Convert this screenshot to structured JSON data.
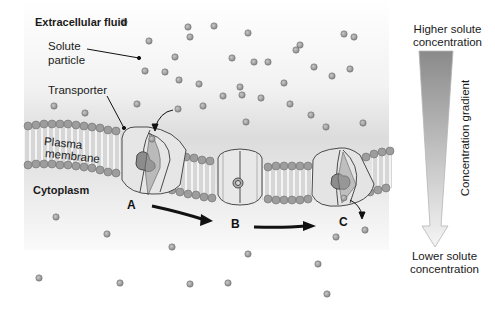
{
  "diagram": {
    "labels": {
      "extracellular": "Extracellular fluid",
      "solute_line1": "Solute",
      "solute_line2": "particle",
      "transporter": "Transporter",
      "membrane_line1": "Plasma",
      "membrane_line2": "membrane",
      "cytoplasm": "Cytoplasm",
      "stage_a": "A",
      "stage_b": "B",
      "stage_c": "C"
    },
    "gradient": {
      "top_line1": "Higher solute",
      "top_line2": "concentration",
      "bottom_line1": "Lower solute",
      "bottom_line2": "concentration",
      "axis_label": "Concentration gradient"
    },
    "colors": {
      "background_top": "#ffffff",
      "background_bottom": "#e6e6e6",
      "particle": "#9a9a9a",
      "transporter": "#e4e4e4",
      "binding_site": "#8c8c8c",
      "lipid_head": "#9d9d9d"
    },
    "particles_outside": [
      [
        124,
        22
      ],
      [
        188,
        27
      ],
      [
        214,
        26
      ],
      [
        248,
        33
      ],
      [
        232,
        58
      ],
      [
        300,
        45
      ],
      [
        296,
        50
      ],
      [
        344,
        34
      ],
      [
        354,
        37
      ],
      [
        254,
        62
      ],
      [
        165,
        72
      ],
      [
        145,
        71
      ],
      [
        175,
        57
      ],
      [
        199,
        84
      ],
      [
        179,
        80
      ],
      [
        268,
        62
      ],
      [
        284,
        83
      ],
      [
        314,
        67
      ],
      [
        332,
        76
      ],
      [
        350,
        69
      ],
      [
        242,
        95
      ],
      [
        223,
        96
      ],
      [
        203,
        106
      ],
      [
        261,
        98
      ],
      [
        290,
        104
      ],
      [
        54,
        106
      ],
      [
        85,
        113
      ],
      [
        137,
        104
      ],
      [
        178,
        109
      ],
      [
        240,
        87
      ],
      [
        246,
        122
      ],
      [
        311,
        115
      ],
      [
        326,
        127
      ],
      [
        363,
        123
      ],
      [
        190,
        37
      ],
      [
        149,
        41
      ]
    ],
    "particles_inside": [
      [
        56,
        217
      ],
      [
        107,
        234
      ],
      [
        172,
        247
      ],
      [
        248,
        254
      ],
      [
        336,
        237
      ],
      [
        318,
        264
      ],
      [
        228,
        283
      ],
      [
        39,
        278
      ],
      [
        120,
        283
      ],
      [
        190,
        284
      ],
      [
        327,
        294
      ],
      [
        365,
        230
      ]
    ]
  }
}
